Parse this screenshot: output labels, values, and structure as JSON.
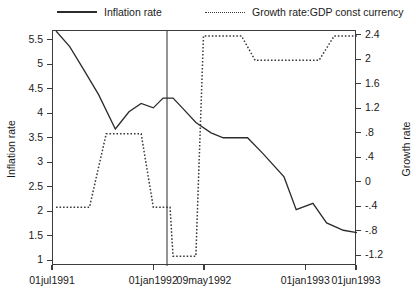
{
  "chart_data": {
    "type": "line",
    "title": "",
    "xlabel": "",
    "ylabel": "Inflation rate",
    "y2label": "Growth rate",
    "grid": false,
    "legend_position": "top",
    "x_tick_labels": [
      "01jul1991",
      "01jan1992",
      "09may1992",
      "01jan1993",
      "01jun1993"
    ],
    "x_tick_positions": [
      0.0,
      0.333,
      0.5,
      0.833,
      1.0
    ],
    "y_tick_labels": [
      "1",
      "1.5",
      "2",
      "2.5",
      "3",
      "3.5",
      "4",
      "4.5",
      "5",
      "5.5"
    ],
    "y_tick_values": [
      1,
      1.5,
      2,
      2.5,
      3,
      3.5,
      4,
      4.5,
      5,
      5.5
    ],
    "ylim": [
      0.9,
      5.7
    ],
    "y2_tick_labels": [
      "-1.2",
      "-.8",
      "-.4",
      "0",
      ".4",
      ".8",
      "1.2",
      "1.6",
      "2",
      "2.4"
    ],
    "y2_tick_values": [
      -1.2,
      -0.8,
      -0.4,
      0,
      0.4,
      0.8,
      1.2,
      1.6,
      2,
      2.4
    ],
    "y2lim": [
      -1.36,
      2.48
    ],
    "reference_line_x": 0.375,
    "reference_line_label": "09may1992",
    "series": [
      {
        "name": "Inflation rate",
        "axis": "left",
        "style": "solid",
        "color": "#2b2b2b",
        "points": [
          [
            0.01,
            5.7
          ],
          [
            0.055,
            5.38
          ],
          [
            0.1,
            4.92
          ],
          [
            0.15,
            4.4
          ],
          [
            0.205,
            3.7
          ],
          [
            0.25,
            4.05
          ],
          [
            0.29,
            4.22
          ],
          [
            0.33,
            4.13
          ],
          [
            0.362,
            4.33
          ],
          [
            0.395,
            4.33
          ],
          [
            0.43,
            4.1
          ],
          [
            0.47,
            3.83
          ],
          [
            0.52,
            3.62
          ],
          [
            0.56,
            3.52
          ],
          [
            0.64,
            3.52
          ],
          [
            0.69,
            3.2
          ],
          [
            0.76,
            2.72
          ],
          [
            0.8,
            2.05
          ],
          [
            0.855,
            2.18
          ],
          [
            0.9,
            1.78
          ],
          [
            0.955,
            1.63
          ],
          [
            1.0,
            1.58
          ]
        ]
      },
      {
        "name": "Growth rate:GDP const currency",
        "axis": "right",
        "style": "dotted",
        "color": "#3a3a3a",
        "points": [
          [
            0.01,
            -0.4
          ],
          [
            0.12,
            -0.4
          ],
          [
            0.175,
            0.8
          ],
          [
            0.29,
            0.8
          ],
          [
            0.33,
            -0.4
          ],
          [
            0.385,
            -0.4
          ],
          [
            0.395,
            -1.2
          ],
          [
            0.47,
            -1.2
          ],
          [
            0.495,
            2.4
          ],
          [
            0.62,
            2.4
          ],
          [
            0.665,
            2.0
          ],
          [
            0.875,
            2.0
          ],
          [
            0.925,
            2.4
          ],
          [
            1.0,
            2.4
          ]
        ]
      }
    ]
  },
  "legend": {
    "entries": [
      {
        "label": "Inflation rate",
        "style": "solid"
      },
      {
        "label": "Growth rate:GDP const currency",
        "style": "dotted"
      }
    ]
  },
  "axes": {
    "left_title": "Inflation rate",
    "right_title": "Growth rate"
  }
}
